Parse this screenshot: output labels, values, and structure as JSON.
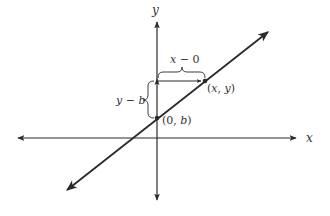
{
  "diagram": {
    "type": "coordinate-plane-slope-intercept",
    "colors": {
      "stroke": "#2a2a2a",
      "text": "#333333",
      "background": "#ffffff"
    },
    "axes": {
      "x_label": "x",
      "y_label": "y"
    },
    "points": [
      {
        "id": "intercept",
        "label_open": "(0, ",
        "label_var": "b",
        "label_close": ")"
      },
      {
        "id": "general",
        "label_open": "(",
        "label_var1": "x",
        "label_sep": ", ",
        "label_var2": "y",
        "label_close": ")"
      }
    ],
    "braces": [
      {
        "id": "horizontal-run",
        "label_var": "x",
        "label_rest": " − 0"
      },
      {
        "id": "vertical-rise",
        "label_var1": "y",
        "label_op": " − ",
        "label_var2": "b"
      }
    ]
  }
}
